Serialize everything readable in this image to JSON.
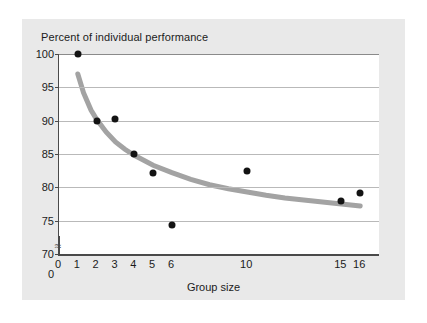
{
  "figure": {
    "background_color": "#e9e9e9",
    "plot_background_color": "#ffffff"
  },
  "chart_data": {
    "type": "scatter",
    "title": "Percent of individual performance",
    "xlabel": "Group size",
    "ylabel": "Percent of individual performance",
    "grid": true,
    "legend": null,
    "xlim": [
      0,
      17
    ],
    "ylim": [
      70,
      100
    ],
    "y_axis_break": true,
    "y_axis_break_symbol": "≈",
    "xticks": [
      0,
      1,
      2,
      3,
      4,
      5,
      6,
      10,
      15,
      16
    ],
    "xtick_labels": [
      "0",
      "1",
      "2",
      "3",
      "4",
      "5",
      "6",
      "10",
      "15",
      "16"
    ],
    "yticks": [
      0,
      70,
      75,
      80,
      85,
      90,
      95,
      100
    ],
    "ytick_labels": [
      "0",
      "70",
      "75",
      "80",
      "85",
      "90",
      "95",
      "100"
    ],
    "x": [
      1,
      2,
      3,
      4,
      5,
      6,
      10,
      15,
      16
    ],
    "y": [
      100,
      90,
      90.3,
      85,
      82.2,
      74.3,
      82.5,
      78,
      79.2
    ],
    "points": [
      {
        "x": 1,
        "y": 100
      },
      {
        "x": 2,
        "y": 90
      },
      {
        "x": 3,
        "y": 90.3
      },
      {
        "x": 4,
        "y": 85
      },
      {
        "x": 5,
        "y": 82.2
      },
      {
        "x": 6,
        "y": 74.3
      },
      {
        "x": 10,
        "y": 82.5
      },
      {
        "x": 15,
        "y": 78
      },
      {
        "x": 16,
        "y": 79.2
      }
    ],
    "point_color": "#131313",
    "fit_curve": {
      "name": "fitted decay curve",
      "color": "#a3a3a3",
      "width": 5,
      "x": [
        1,
        1.3,
        1.7,
        2,
        2.5,
        3,
        3.5,
        4,
        5,
        6,
        7,
        8,
        9,
        10,
        11,
        12,
        13,
        14,
        15,
        16
      ],
      "y": [
        97,
        94.2,
        91.6,
        90.2,
        88.3,
        86.8,
        85.7,
        84.8,
        83.3,
        82.2,
        81.2,
        80.4,
        79.8,
        79.3,
        78.8,
        78.4,
        78.1,
        77.8,
        77.5,
        77.2
      ]
    }
  }
}
